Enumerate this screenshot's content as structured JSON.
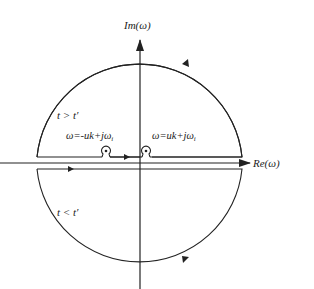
{
  "diagram": {
    "type": "complex-plane-contour",
    "axes": {
      "imag_label": "Im(ω)",
      "real_label": "Re(ω)"
    },
    "regions": {
      "upper": "t > t′",
      "lower": "t < t′"
    },
    "poles": {
      "left": "ω=-uk+jω",
      "left_sub": "i",
      "right": "ω=uk+jω",
      "right_sub": "i"
    },
    "colors": {
      "stroke": "#222222",
      "background": "#ffffff"
    }
  }
}
